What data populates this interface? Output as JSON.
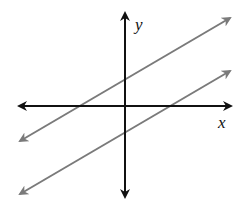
{
  "diagram": {
    "type": "coordinate-plane-parallel-lines",
    "axes": {
      "x_label": "x",
      "y_label": "y",
      "color": "#111111"
    },
    "lines": [
      {
        "name": "upper-line",
        "color": "#7a7a7a",
        "y_intercept_above_origin": true
      },
      {
        "name": "lower-line",
        "color": "#7a7a7a",
        "y_intercept_above_origin": false
      }
    ]
  }
}
